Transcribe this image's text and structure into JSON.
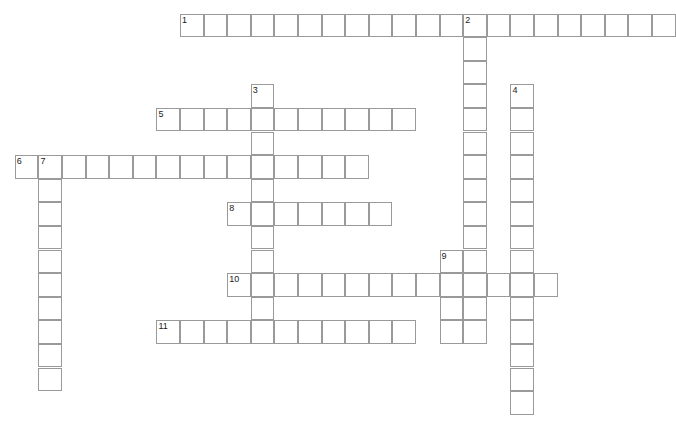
{
  "puzzle": {
    "title": "Crossword Grid",
    "grid_metrics": {
      "cell_width": 23.6,
      "cell_height": 23.6,
      "origin_x": 14.8,
      "origin_y": 13.5,
      "columns": 28,
      "rows": 17,
      "border_color": "#9a9a9a",
      "cell_fill": "#ffffff",
      "background": "#ffffff",
      "number_color": "#1a1a1a",
      "number_font_size": "9px"
    },
    "entries": [
      {
        "number": "1",
        "direction": "across",
        "start_col": 7,
        "start_row": 0,
        "length": 21,
        "x": 180.0,
        "y": 13.5,
        "width": 495.6,
        "height": 23.6
      },
      {
        "number": "2",
        "direction": "down",
        "start_col": 19,
        "start_row": 0,
        "length": 15,
        "x": 483.2,
        "y": 13.5,
        "width": 23.6,
        "height": 354.0
      },
      {
        "number": "3",
        "direction": "down",
        "start_col": 10,
        "start_row": 3,
        "length": 11,
        "x": 250.8,
        "y": 84.3,
        "width": 23.6,
        "height": 259.6
      },
      {
        "number": "4",
        "direction": "down",
        "start_col": 21,
        "start_row": 3,
        "length": 14,
        "x": 530.4,
        "y": 84.3,
        "width": 23.6,
        "height": 330.4
      },
      {
        "number": "5",
        "direction": "across",
        "start_col": 6,
        "start_row": 4,
        "length": 11,
        "x": 156.4,
        "y": 107.9,
        "width": 259.6,
        "height": 23.6
      },
      {
        "number": "6",
        "direction": "across",
        "start_col": 0,
        "start_row": 6,
        "length": 15,
        "x": 14.8,
        "y": 155.1,
        "width": 354.0,
        "height": 23.6
      },
      {
        "number": "7",
        "direction": "down",
        "start_col": 1,
        "start_row": 6,
        "length": 10,
        "x": 38.4,
        "y": 155.1,
        "width": 23.6,
        "height": 236.0
      },
      {
        "number": "8",
        "direction": "across",
        "start_col": 9,
        "start_row": 8,
        "length": 7,
        "x": 227.2,
        "y": 202.3,
        "width": 165.2,
        "height": 23.6
      },
      {
        "number": "9",
        "direction": "down",
        "start_col": 18,
        "start_row": 10,
        "length": 4,
        "x": 459.6,
        "y": 249.5,
        "width": 23.6,
        "height": 94.4
      },
      {
        "number": "10",
        "direction": "across",
        "start_col": 9,
        "start_row": 11,
        "length": 14,
        "x": 227.2,
        "y": 273.1,
        "width": 330.4,
        "height": 23.6
      },
      {
        "number": "11",
        "direction": "across",
        "start_col": 6,
        "start_row": 13,
        "length": 11,
        "x": 156.4,
        "y": 320.3,
        "width": 259.6,
        "height": 23.6
      }
    ],
    "cells": [
      {
        "col": 7,
        "row": 0
      },
      {
        "col": 8,
        "row": 0
      },
      {
        "col": 9,
        "row": 0
      },
      {
        "col": 10,
        "row": 0
      },
      {
        "col": 11,
        "row": 0
      },
      {
        "col": 12,
        "row": 0
      },
      {
        "col": 13,
        "row": 0
      },
      {
        "col": 14,
        "row": 0
      },
      {
        "col": 15,
        "row": 0
      },
      {
        "col": 16,
        "row": 0
      },
      {
        "col": 17,
        "row": 0
      },
      {
        "col": 18,
        "row": 0
      },
      {
        "col": 19,
        "row": 0
      },
      {
        "col": 20,
        "row": 0
      },
      {
        "col": 21,
        "row": 0
      },
      {
        "col": 22,
        "row": 0
      },
      {
        "col": 23,
        "row": 0
      },
      {
        "col": 24,
        "row": 0
      },
      {
        "col": 25,
        "row": 0
      },
      {
        "col": 26,
        "row": 0
      },
      {
        "col": 27,
        "row": 0
      },
      {
        "col": 19,
        "row": 1
      },
      {
        "col": 19,
        "row": 2
      },
      {
        "col": 10,
        "row": 3
      },
      {
        "col": 19,
        "row": 3
      },
      {
        "col": 21,
        "row": 3
      },
      {
        "col": 6,
        "row": 4
      },
      {
        "col": 7,
        "row": 4
      },
      {
        "col": 8,
        "row": 4
      },
      {
        "col": 9,
        "row": 4
      },
      {
        "col": 10,
        "row": 4
      },
      {
        "col": 11,
        "row": 4
      },
      {
        "col": 12,
        "row": 4
      },
      {
        "col": 13,
        "row": 4
      },
      {
        "col": 14,
        "row": 4
      },
      {
        "col": 15,
        "row": 4
      },
      {
        "col": 16,
        "row": 4
      },
      {
        "col": 19,
        "row": 4
      },
      {
        "col": 21,
        "row": 4
      },
      {
        "col": 10,
        "row": 5
      },
      {
        "col": 19,
        "row": 5
      },
      {
        "col": 21,
        "row": 5
      },
      {
        "col": 0,
        "row": 6
      },
      {
        "col": 1,
        "row": 6
      },
      {
        "col": 2,
        "row": 6
      },
      {
        "col": 3,
        "row": 6
      },
      {
        "col": 4,
        "row": 6
      },
      {
        "col": 5,
        "row": 6
      },
      {
        "col": 6,
        "row": 6
      },
      {
        "col": 7,
        "row": 6
      },
      {
        "col": 8,
        "row": 6
      },
      {
        "col": 9,
        "row": 6
      },
      {
        "col": 10,
        "row": 6
      },
      {
        "col": 11,
        "row": 6
      },
      {
        "col": 12,
        "row": 6
      },
      {
        "col": 13,
        "row": 6
      },
      {
        "col": 14,
        "row": 6
      },
      {
        "col": 19,
        "row": 6
      },
      {
        "col": 21,
        "row": 6
      },
      {
        "col": 1,
        "row": 7
      },
      {
        "col": 10,
        "row": 7
      },
      {
        "col": 19,
        "row": 7
      },
      {
        "col": 21,
        "row": 7
      },
      {
        "col": 1,
        "row": 8
      },
      {
        "col": 9,
        "row": 8
      },
      {
        "col": 10,
        "row": 8
      },
      {
        "col": 11,
        "row": 8
      },
      {
        "col": 12,
        "row": 8
      },
      {
        "col": 13,
        "row": 8
      },
      {
        "col": 14,
        "row": 8
      },
      {
        "col": 15,
        "row": 8
      },
      {
        "col": 19,
        "row": 8
      },
      {
        "col": 21,
        "row": 8
      },
      {
        "col": 1,
        "row": 9
      },
      {
        "col": 10,
        "row": 9
      },
      {
        "col": 19,
        "row": 9
      },
      {
        "col": 21,
        "row": 9
      },
      {
        "col": 1,
        "row": 10
      },
      {
        "col": 10,
        "row": 10
      },
      {
        "col": 18,
        "row": 10
      },
      {
        "col": 19,
        "row": 10
      },
      {
        "col": 21,
        "row": 10
      },
      {
        "col": 1,
        "row": 11
      },
      {
        "col": 9,
        "row": 11
      },
      {
        "col": 10,
        "row": 11
      },
      {
        "col": 11,
        "row": 11
      },
      {
        "col": 12,
        "row": 11
      },
      {
        "col": 13,
        "row": 11
      },
      {
        "col": 14,
        "row": 11
      },
      {
        "col": 15,
        "row": 11
      },
      {
        "col": 16,
        "row": 11
      },
      {
        "col": 17,
        "row": 11
      },
      {
        "col": 18,
        "row": 11
      },
      {
        "col": 19,
        "row": 11
      },
      {
        "col": 20,
        "row": 11
      },
      {
        "col": 21,
        "row": 11
      },
      {
        "col": 22,
        "row": 11
      },
      {
        "col": 1,
        "row": 12
      },
      {
        "col": 10,
        "row": 12
      },
      {
        "col": 18,
        "row": 12
      },
      {
        "col": 19,
        "row": 12
      },
      {
        "col": 21,
        "row": 12
      },
      {
        "col": 1,
        "row": 13
      },
      {
        "col": 6,
        "row": 13
      },
      {
        "col": 7,
        "row": 13
      },
      {
        "col": 8,
        "row": 13
      },
      {
        "col": 9,
        "row": 13
      },
      {
        "col": 10,
        "row": 13
      },
      {
        "col": 11,
        "row": 13
      },
      {
        "col": 12,
        "row": 13
      },
      {
        "col": 13,
        "row": 13
      },
      {
        "col": 14,
        "row": 13
      },
      {
        "col": 15,
        "row": 13
      },
      {
        "col": 16,
        "row": 13
      },
      {
        "col": 18,
        "row": 13
      },
      {
        "col": 19,
        "row": 13
      },
      {
        "col": 21,
        "row": 13
      },
      {
        "col": 1,
        "row": 14
      },
      {
        "col": 21,
        "row": 14
      },
      {
        "col": 1,
        "row": 15
      },
      {
        "col": 21,
        "row": 15
      },
      {
        "col": 21,
        "row": 16
      }
    ],
    "numbers": [
      {
        "label": "1",
        "col": 7,
        "row": 0
      },
      {
        "label": "2",
        "col": 19,
        "row": 0
      },
      {
        "label": "3",
        "col": 10,
        "row": 3
      },
      {
        "label": "4",
        "col": 21,
        "row": 3
      },
      {
        "label": "5",
        "col": 6,
        "row": 4
      },
      {
        "label": "6",
        "col": 0,
        "row": 6
      },
      {
        "label": "7",
        "col": 1,
        "row": 6
      },
      {
        "label": "8",
        "col": 9,
        "row": 8
      },
      {
        "label": "9",
        "col": 18,
        "row": 10
      },
      {
        "label": "10",
        "col": 9,
        "row": 11
      },
      {
        "label": "11",
        "col": 6,
        "row": 13
      }
    ]
  }
}
